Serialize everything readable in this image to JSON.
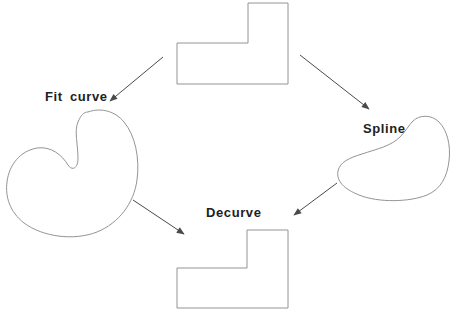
{
  "diagram": {
    "background": "#ffffff",
    "colors": {
      "shape_outline": "#949494",
      "arrow": "#4a4a4a",
      "text": "#212121"
    },
    "labels": {
      "fit_curve": "Fit curve",
      "spline": "Spline",
      "decurve": "Decurve"
    },
    "nodes": [
      {
        "id": "original-polyline",
        "kind": "L-shaped polyline",
        "position": "top-center"
      },
      {
        "id": "fit-curve-blob",
        "kind": "fit-curved closed blob",
        "position": "left"
      },
      {
        "id": "spline-blob",
        "kind": "splined closed blob",
        "position": "right"
      },
      {
        "id": "decurved-polyline",
        "kind": "L-shaped polyline",
        "position": "bottom-center"
      }
    ],
    "arrows": [
      {
        "from": "original-polyline",
        "to": "fit-curve-blob",
        "direction": "down-left"
      },
      {
        "from": "original-polyline",
        "to": "spline-blob",
        "direction": "down-right"
      },
      {
        "from": "fit-curve-blob",
        "to": "decurved-polyline",
        "direction": "down-right"
      },
      {
        "from": "spline-blob",
        "to": "decurved-polyline",
        "direction": "down-left"
      }
    ]
  }
}
